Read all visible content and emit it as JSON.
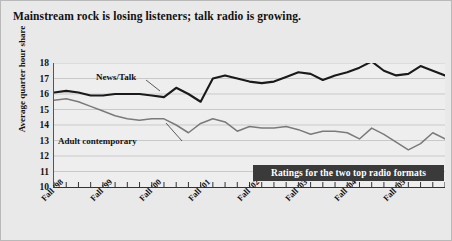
{
  "title": "Mainstream rock is losing listeners; talk radio is growing.",
  "caption": "Ratings for the two top radio formats",
  "labels": {
    "news_talk": "News/Talk",
    "adult_contemporary": "Adult contemporary"
  },
  "colors": {
    "background": "#e9e9e9",
    "plot_background": "#eeeeee",
    "news_talk": "#1a1a1a",
    "adult_contemporary": "#7a7a7a",
    "gridline": "#c9c9c9",
    "caption_background": "#3a3a3a",
    "caption_text": "#ffffff",
    "axis": "#333333"
  },
  "chart_data": {
    "type": "line",
    "title": "Mainstream rock is losing listeners; talk radio is growing.",
    "xlabel": "",
    "ylabel": "Average quarter hour share",
    "ylim": [
      10,
      18
    ],
    "yticks": [
      18,
      17,
      16,
      15,
      14,
      13,
      12,
      11,
      10
    ],
    "grid": true,
    "legend": "inline-annotations",
    "xtick_labels": [
      "Fall '98",
      "Fall '99",
      "Fall '00",
      "Fall '01",
      "Fall '02",
      "Fall '03",
      "Fall '04",
      "Fall '05"
    ],
    "xtick_indices": [
      0,
      4,
      8,
      12,
      16,
      20,
      24,
      28
    ],
    "x": [
      0,
      1,
      2,
      3,
      4,
      5,
      6,
      7,
      8,
      9,
      10,
      11,
      12,
      13,
      14,
      15,
      16,
      17,
      18,
      19,
      20,
      21,
      22,
      23,
      24,
      25,
      26,
      27,
      28,
      29,
      30,
      31,
      32
    ],
    "series": [
      {
        "name": "News/Talk",
        "color": "#1a1a1a",
        "values": [
          16.1,
          16.2,
          16.1,
          15.9,
          15.9,
          16.0,
          16.0,
          16.0,
          15.9,
          15.8,
          16.4,
          16.0,
          15.5,
          17.0,
          17.2,
          17.0,
          16.8,
          16.7,
          16.8,
          17.1,
          17.4,
          17.3,
          16.9,
          17.2,
          17.4,
          17.7,
          18.1,
          17.5,
          17.2,
          17.3,
          17.8,
          17.5,
          17.2
        ]
      },
      {
        "name": "Adult contemporary",
        "color": "#7a7a7a",
        "values": [
          15.6,
          15.7,
          15.5,
          15.2,
          14.9,
          14.6,
          14.4,
          14.3,
          14.4,
          14.4,
          14.0,
          13.5,
          14.1,
          14.4,
          14.2,
          13.6,
          13.9,
          13.8,
          13.8,
          13.9,
          13.7,
          13.4,
          13.6,
          13.6,
          13.5,
          13.1,
          13.8,
          13.4,
          12.9,
          12.4,
          12.8,
          13.5,
          13.1
        ]
      }
    ]
  }
}
